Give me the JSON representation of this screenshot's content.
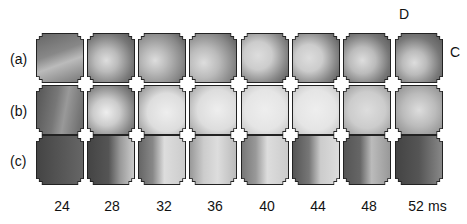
{
  "figure": {
    "row_labels": [
      "(a)",
      "(b)",
      "(c)"
    ],
    "time_labels": [
      "24",
      "28",
      "32",
      "36",
      "40",
      "44",
      "48",
      "52"
    ],
    "time_unit": "ms",
    "orientation_labels": {
      "top": "D",
      "right": "C"
    }
  },
  "tiles": {
    "a": [
      {
        "bg": "linear-gradient(160deg,#666 0%,#888 40%,#bbb 60%,#777 100%)"
      },
      {
        "bg": "radial-gradient(circle at 40% 55%,#ddd 0%,#bbb 30%,#777 70%,#555 100%)"
      },
      {
        "bg": "radial-gradient(circle at 35% 55%,#ddd 0%,#bbb 30%,#888 70%,#555 100%)"
      },
      {
        "bg": "radial-gradient(circle at 30% 60%,#ddd 0%,#bbb 35%,#888 70%,#555 100%)"
      },
      {
        "bg": "radial-gradient(circle at 35% 45%,#ddd 0%,#ccc 35%,#888 70%,#555 100%)"
      },
      {
        "bg": "radial-gradient(circle at 35% 50%,#ddd 0%,#ccc 35%,#888 70%,#555 100%)"
      },
      {
        "bg": "radial-gradient(circle at 40% 55%,#ddd 0%,#bbb 35%,#777 70%,#555 100%)"
      },
      {
        "bg": "radial-gradient(circle at 40% 60%,#ddd 0%,#bbb 30%,#777 65%,#555 100%)"
      }
    ],
    "b": [
      {
        "bg": "linear-gradient(100deg,#555 0%,#777 40%,#999 60%,#666 100%)"
      },
      {
        "bg": "radial-gradient(circle at 40% 55%,#eee 0%,#ccc 35%,#888 70%,#555 100%)"
      },
      {
        "bg": "radial-gradient(circle at 60% 55%,#eee 0%,#ddd 50%,#aaa 80%,#888 100%)"
      },
      {
        "bg": "radial-gradient(circle at 60% 50%,#eee 0%,#ddd 55%,#bbb 80%,#999 100%)"
      },
      {
        "bg": "radial-gradient(circle at 50% 50%,#eee 0%,#e5e5e5 60%,#ccc 90%,#aaa 100%)"
      },
      {
        "bg": "radial-gradient(circle at 50% 50%,#eee 0%,#e5e5e5 60%,#ccc 90%,#aaa 100%)"
      },
      {
        "bg": "radial-gradient(circle at 50% 50%,#ddd 0%,#ccc 55%,#aaa 85%,#999 100%)"
      },
      {
        "bg": "radial-gradient(circle at 50% 50%,#ddd 0%,#bbb 50%,#999 85%,#888 100%)"
      }
    ],
    "c": [
      {
        "bg": "linear-gradient(90deg,#444 0%,#555 50%,#666 100%)"
      },
      {
        "bg": "linear-gradient(90deg,#444 0%,#555 45%,#999 70%,#ccc 100%)"
      },
      {
        "bg": "linear-gradient(90deg,#666 0%,#888 30%,#ddd 55%,#ccc 100%)"
      },
      {
        "bg": "linear-gradient(90deg,#999 0%,#ccc 30%,#ddd 60%,#bbb 100%)"
      },
      {
        "bg": "linear-gradient(90deg,#777 0%,#999 30%,#ddd 55%,#ccc 100%)"
      },
      {
        "bg": "linear-gradient(90deg,#555 0%,#777 35%,#ccc 60%,#ddd 100%)"
      },
      {
        "bg": "linear-gradient(90deg,#555 0%,#666 35%,#bbb 60%,#999 100%)"
      },
      {
        "bg": "linear-gradient(90deg,#444 0%,#555 50%,#888 100%)"
      }
    ]
  }
}
